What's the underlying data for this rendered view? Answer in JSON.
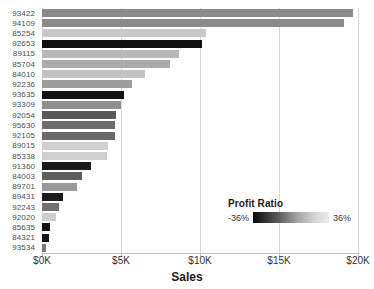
{
  "chart_data": {
    "type": "bar",
    "orientation": "horizontal",
    "title": "",
    "xlabel": "Sales",
    "ylabel": "",
    "xlim": [
      0,
      20000
    ],
    "xticks": [
      0,
      5000,
      10000,
      15000,
      20000
    ],
    "xtick_labels": [
      "$0K",
      "$5K",
      "$10K",
      "$15K",
      "$20K"
    ],
    "grid": true,
    "grid_axis": "x",
    "legend": {
      "title": "Profit Ratio",
      "position": "inside-lower-right",
      "type": "colorbar",
      "min_label": "-36%",
      "max_label": "36%",
      "min_value": -36,
      "max_value": 36,
      "colors": [
        "#0a0a0a",
        "#3b3b3b",
        "#6e6e6e",
        "#a8a8a8",
        "#d2d2d2",
        "#ececec"
      ]
    },
    "categories": [
      "93422",
      "94109",
      "85254",
      "92653",
      "89115",
      "85704",
      "84010",
      "92236",
      "93635",
      "93309",
      "92054",
      "95630",
      "92105",
      "89015",
      "85338",
      "91360",
      "84003",
      "89701",
      "89431",
      "92243",
      "92020",
      "85635",
      "84321",
      "93534"
    ],
    "values": [
      19700,
      19100,
      10400,
      10100,
      8700,
      8100,
      6500,
      5700,
      5200,
      5000,
      4700,
      4650,
      4600,
      4200,
      4100,
      3100,
      2500,
      2200,
      1300,
      1100,
      900,
      500,
      450,
      250
    ],
    "profit_ratio": [
      -4,
      -6,
      22,
      -36,
      16,
      10,
      26,
      4,
      -34,
      -2,
      -12,
      -8,
      -10,
      24,
      28,
      -30,
      -14,
      6,
      -32,
      -16,
      20,
      -35,
      -34,
      -18
    ],
    "bar_colors": [
      "#8a8a8a",
      "#8a8a8a",
      "#c8c8c8",
      "#111111",
      "#b8b8b8",
      "#aaaaaa",
      "#c2c2c2",
      "#9e9e9e",
      "#121212",
      "#8f8f8f",
      "#585858",
      "#6d6d6d",
      "#6a6a6a",
      "#d0d0d0",
      "#cfcfcf",
      "#1a1a1a",
      "#5e5e5e",
      "#9a9a9a",
      "#1c1c1c",
      "#707070",
      "#cccccc",
      "#141414",
      "#141414",
      "#7a7a7a"
    ]
  }
}
